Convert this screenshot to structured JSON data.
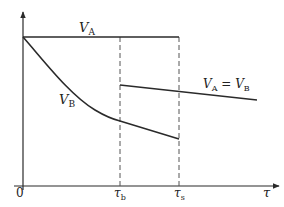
{
  "diagram": {
    "title": "",
    "axes": {
      "origin_label": "0",
      "x_axis_symbol": "τ",
      "y_axis_symbol": ""
    },
    "ticks": [
      {
        "symbol": "τ",
        "subscript": "b"
      },
      {
        "symbol": "τ",
        "subscript": "s"
      }
    ],
    "curves": [
      {
        "name": "V",
        "subscript": "A",
        "description": "horizontal constant line from 0 to τs"
      },
      {
        "name": "V",
        "subscript": "B",
        "description": "decreasing curve from 0 to τs"
      },
      {
        "name": "V_A = V_B",
        "description": "slowly decreasing line starting at τb"
      }
    ],
    "labels": {
      "va": {
        "main": "V",
        "sub": "A"
      },
      "vb": {
        "main": "V",
        "sub": "B"
      },
      "vavb": {
        "main1": "V",
        "sub1": "A",
        "eq": " = ",
        "main2": "V",
        "sub2": "B"
      }
    },
    "colors": {
      "line": "#2a2a2a",
      "dashed": "#555555",
      "background": "#ffffff"
    }
  }
}
